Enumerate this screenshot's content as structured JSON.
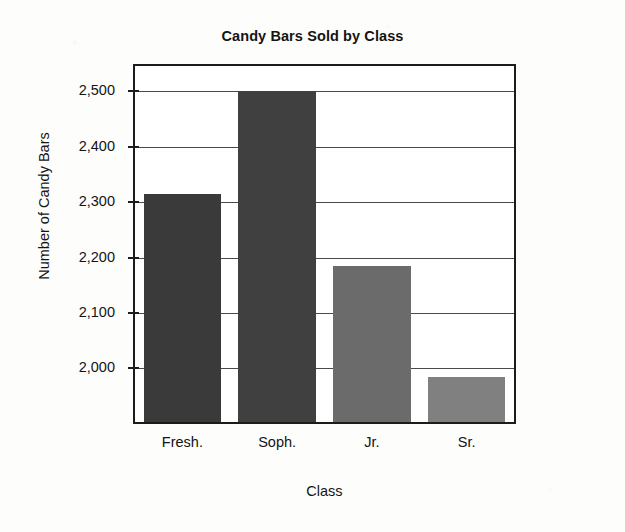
{
  "chart_data": {
    "type": "bar",
    "title": "Candy Bars Sold by Class",
    "xlabel": "Class",
    "ylabel": "Number of Candy Bars",
    "categories": [
      "Fresh.",
      "Soph.",
      "Jr.",
      "Sr."
    ],
    "values": [
      2315,
      2500,
      2185,
      1985
    ],
    "ytick_labels": [
      "2,500",
      "2,400",
      "2,300",
      "2,200",
      "2,100",
      "2,000"
    ],
    "ytick_values": [
      2500,
      2400,
      2300,
      2200,
      2100,
      2000
    ],
    "ylim": [
      1903,
      2546
    ],
    "grid": true,
    "legend": false,
    "bar_colors": [
      "#3a3a3a",
      "#404040",
      "#6b6b6b",
      "#808080"
    ],
    "axis_color": "#1c1c1c",
    "plot_background": "#ffffff",
    "page_background": "#fdfdfb"
  }
}
